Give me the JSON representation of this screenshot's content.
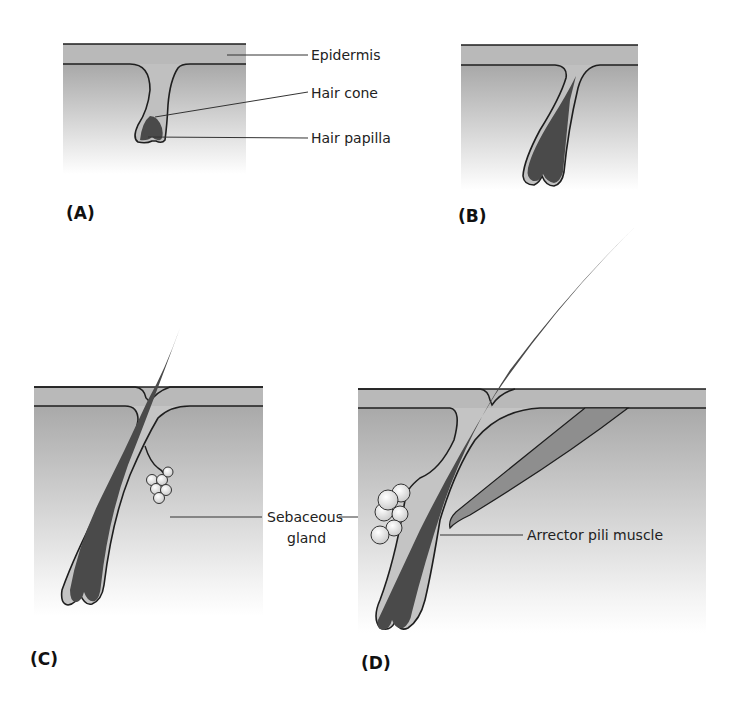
{
  "figure": {
    "colors": {
      "epidermis": "#b9b9b9",
      "dermis_top": "#aaaaaa",
      "dermis_bottom": "#ffffff",
      "follicle_sheath": "#c4c4c4",
      "hair": "#4a4a4a",
      "outline": "#1e1e1e",
      "gland": "#e4e4e4",
      "muscle": "#8e8e8e"
    },
    "panels": [
      {
        "id": "A",
        "label": "(A)",
        "callouts": [
          "Epidermis",
          "Hair cone",
          "Hair papilla"
        ]
      },
      {
        "id": "B",
        "label": "(B)",
        "callouts": []
      },
      {
        "id": "C",
        "label": "(C)",
        "callouts": [
          "Sebaceous gland"
        ]
      },
      {
        "id": "D",
        "label": "(D)",
        "callouts": [
          "Arrector pili muscle"
        ]
      }
    ],
    "labels": {
      "epidermis": "Epidermis",
      "hair_cone": "Hair cone",
      "hair_papilla": "Hair papilla",
      "sebaceous_line1": "Sebaceous",
      "sebaceous_line2": "gland",
      "arrector": "Arrector pili muscle"
    }
  }
}
